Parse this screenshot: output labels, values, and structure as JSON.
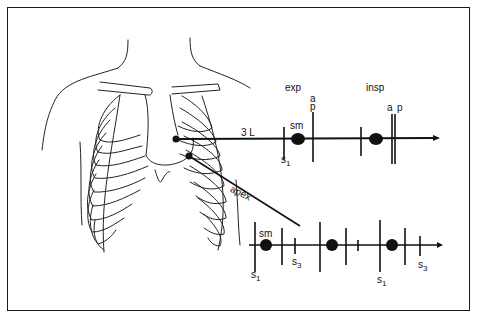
{
  "diagram": {
    "type": "auscultation diagram with phonocardiogram traces",
    "colors": {
      "ink": "#111111",
      "background": "#ffffff"
    },
    "sites": [
      {
        "label": "3 L",
        "description": "third left intercostal space"
      },
      {
        "label": "apex",
        "description": "cardiac apex"
      }
    ],
    "top_trace": {
      "site": "3 L",
      "phases": {
        "exp": "exp",
        "insp": "insp"
      },
      "labels": {
        "s1": "s",
        "s1_sub": "1",
        "sm": "sm",
        "a_exp": "a",
        "p_exp": "p",
        "a_insp": "a",
        "p_insp": "p"
      }
    },
    "bottom_trace": {
      "site": "apex",
      "labels": {
        "s1_first": "s",
        "s1_first_sub": "1",
        "sm": "sm",
        "s3_first": "s",
        "s3_first_sub": "3",
        "s1_second": "s",
        "s1_second_sub": "1",
        "s3_second": "s",
        "s3_second_sub": "3"
      }
    }
  }
}
